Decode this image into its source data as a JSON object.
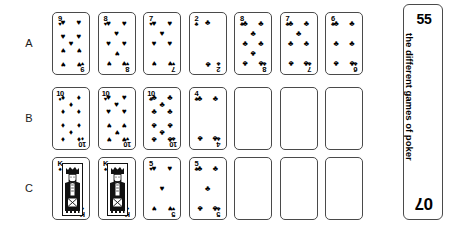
{
  "page": {
    "width": 453,
    "height": 229,
    "background": "#ffffff",
    "ink_color": "#000000",
    "card_border_color": "#4a4a4a"
  },
  "rows": [
    {
      "label": "A",
      "top": 12,
      "cards": [
        {
          "rank": "9",
          "suit": "hearts",
          "empty": false
        },
        {
          "rank": "8",
          "suit": "hearts",
          "empty": false
        },
        {
          "rank": "7",
          "suit": "hearts",
          "empty": false
        },
        {
          "rank": "2",
          "suit": "clubs",
          "empty": false
        },
        {
          "rank": "8",
          "suit": "clubs",
          "empty": false
        },
        {
          "rank": "7",
          "suit": "clubs",
          "empty": false
        },
        {
          "rank": "6",
          "suit": "clubs",
          "empty": false
        }
      ]
    },
    {
      "label": "B",
      "top": 87,
      "cards": [
        {
          "rank": "10",
          "suit": "diamonds",
          "empty": false
        },
        {
          "rank": "10",
          "suit": "hearts",
          "empty": false
        },
        {
          "rank": "10",
          "suit": "clubs",
          "empty": false
        },
        {
          "rank": "4",
          "suit": "clubs",
          "empty": false
        },
        {
          "rank": "",
          "suit": "",
          "empty": true
        },
        {
          "rank": "",
          "suit": "",
          "empty": true
        },
        {
          "rank": "",
          "suit": "",
          "empty": true
        }
      ]
    },
    {
      "label": "C",
      "top": 157,
      "cards": [
        {
          "rank": "K",
          "suit": "spades",
          "empty": false,
          "face": "king"
        },
        {
          "rank": "K",
          "suit": "spades",
          "empty": false,
          "face": "king"
        },
        {
          "rank": "5",
          "suit": "hearts",
          "empty": false
        },
        {
          "rank": "5",
          "suit": "clubs",
          "empty": false
        },
        {
          "rank": "",
          "suit": "",
          "empty": true
        },
        {
          "rank": "",
          "suit": "",
          "empty": true
        },
        {
          "rank": "",
          "suit": "",
          "empty": true
        }
      ]
    }
  ],
  "suit_glyphs": {
    "hearts": "♥",
    "spades": "♠",
    "clubs": "♣",
    "diamonds": "♦"
  },
  "side_tab": {
    "page_number": "55",
    "title": "the different games of poker",
    "chapter_number": "07"
  }
}
